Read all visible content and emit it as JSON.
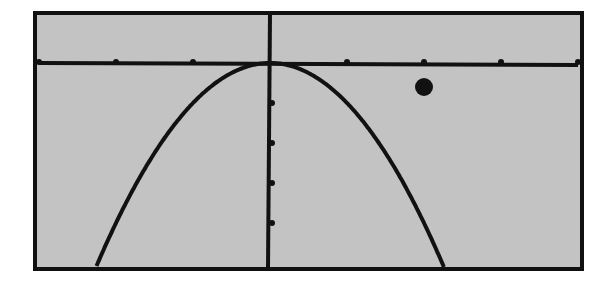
{
  "chart_data": {
    "type": "line",
    "title": "",
    "xlabel": "",
    "ylabel": "",
    "xlim": [
      -3,
      4
    ],
    "ylim": [
      -5.2,
      1.3
    ],
    "xscale": 1,
    "yscale": 1,
    "grid": false,
    "legend": null,
    "x_ticks": [
      -3,
      -2,
      -1,
      1,
      2,
      3,
      4
    ],
    "y_ticks": [
      -1,
      -2,
      -3,
      -4
    ],
    "series": [
      {
        "name": "y = -x^2",
        "kind": "curve",
        "equation": "y = -x^2",
        "x": [
          -2.2,
          -2,
          -1.5,
          -1,
          -0.5,
          0,
          0.5,
          1,
          1.5,
          2,
          2.2
        ],
        "y": [
          -4.84,
          -4,
          -2.25,
          -1,
          -0.25,
          0,
          -0.25,
          -1,
          -2.25,
          -4,
          -4.84
        ]
      },
      {
        "name": "point",
        "kind": "scatter",
        "x": [
          2
        ],
        "y": [
          -0.6
        ]
      }
    ]
  },
  "style": {
    "screen_bg": "#c3c3c3",
    "page_bg": "#ffffff",
    "ink": "#111111"
  },
  "layout": {
    "frame": {
      "left": 35,
      "top": 13,
      "right": 582,
      "bottom": 269
    },
    "origin_px": [
      270,
      63
    ],
    "px_per_x": 77,
    "px_per_y": 40
  }
}
